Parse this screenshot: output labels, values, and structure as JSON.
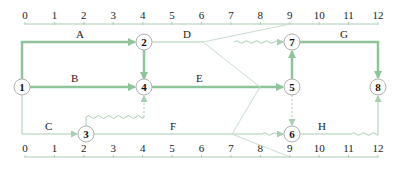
{
  "diagram": {
    "type": "time-scaled-network",
    "colors": {
      "critical": "#8fc49a",
      "normal": "#a9cdb0",
      "axis": "#a9cdb0",
      "node_stroke": "#b0b0b0",
      "text": "#222222"
    },
    "top_scale": {
      "ticks": [
        "0",
        "1",
        "2",
        "3",
        "4",
        "5",
        "6",
        "7",
        "8",
        "9",
        "10",
        "11",
        "12"
      ]
    },
    "bottom_scale": {
      "ticks": [
        "0",
        "1",
        "2",
        "3",
        "4",
        "5",
        "6",
        "7",
        "8",
        "9",
        "10",
        "11",
        "12"
      ]
    },
    "nodes": [
      {
        "id": "1",
        "label": "1",
        "time": 0
      },
      {
        "id": "2",
        "label": "2",
        "time": 4
      },
      {
        "id": "3",
        "label": "3",
        "time": 2
      },
      {
        "id": "4",
        "label": "4",
        "time": 4
      },
      {
        "id": "5",
        "label": "5",
        "time": 9
      },
      {
        "id": "6",
        "label": "6",
        "time": 9
      },
      {
        "id": "7",
        "label": "7",
        "time": 9
      },
      {
        "id": "8",
        "label": "8",
        "time": 12
      }
    ],
    "activities": [
      {
        "name": "A",
        "from": "1",
        "to": "2",
        "duration": 4,
        "critical": true
      },
      {
        "name": "B",
        "from": "1",
        "to": "4",
        "duration": 4,
        "critical": true
      },
      {
        "name": "C",
        "from": "1",
        "to": "3",
        "duration": 2,
        "critical": false
      },
      {
        "name": "D",
        "from": "2",
        "to": "7",
        "duration": 2,
        "free_float": 3,
        "critical": false
      },
      {
        "name": "E",
        "from": "4",
        "to": "5",
        "duration": 5,
        "critical": true
      },
      {
        "name": "F",
        "from": "3",
        "to": "6",
        "duration": 5,
        "free_float": 2,
        "critical": false
      },
      {
        "name": "G",
        "from": "7",
        "to": "8",
        "duration": 3,
        "critical": true
      },
      {
        "name": "H",
        "from": "6",
        "to": "8",
        "duration": 1,
        "free_float": 2,
        "critical": false
      }
    ],
    "dummies": [
      {
        "from": "2",
        "to": "4",
        "critical": true
      },
      {
        "from": "3",
        "to": "4",
        "float": 2,
        "critical": false
      },
      {
        "from": "5",
        "to": "7",
        "critical": true
      },
      {
        "from": "5",
        "to": "6",
        "critical": false
      }
    ],
    "labels": {
      "A": "A",
      "B": "B",
      "C": "C",
      "D": "D",
      "E": "E",
      "F": "F",
      "G": "G",
      "H": "H"
    }
  }
}
